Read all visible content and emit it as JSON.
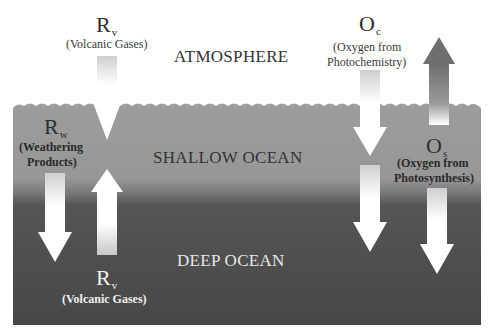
{
  "regions": {
    "atmosphere": "ATMOSPHERE",
    "shallow_ocean": "SHALLOW OCEAN",
    "deep_ocean": "DEEP OCEAN"
  },
  "fluxes": {
    "rv_top": {
      "symbol": "R",
      "subscript": "v",
      "description": "(Volcanic Gases)",
      "direction": "down",
      "from": "atmosphere",
      "to": "shallow ocean"
    },
    "rw": {
      "symbol": "R",
      "subscript": "w",
      "description_line1": "(Weathering",
      "description_line2": "Products)",
      "direction": "down",
      "from": "shallow ocean",
      "to": "deep ocean"
    },
    "rv_bottom": {
      "symbol": "R",
      "subscript": "v",
      "description": "(Volcanic Gases)",
      "direction": "up",
      "from": "deep ocean",
      "to": "shallow ocean"
    },
    "oc": {
      "symbol": "O",
      "subscript": "c",
      "description_line1": "(Oxygen from",
      "description_line2": "Photochemistry)",
      "direction": "down",
      "from": "atmosphere",
      "to": "deep ocean"
    },
    "os": {
      "symbol": "O",
      "subscript": "s",
      "description_line1": "(Oxygen from",
      "description_line2": "Photosynthesis)",
      "direction": "both",
      "from": "shallow ocean",
      "to": "atmosphere and deep ocean"
    }
  },
  "colors": {
    "background": "#ffffff",
    "shallow_ocean": "#9a9a9a",
    "deep_ocean": "#4a4a4a",
    "arrow_light": "#ffffff",
    "arrow_dark": "#6a6a6a"
  }
}
